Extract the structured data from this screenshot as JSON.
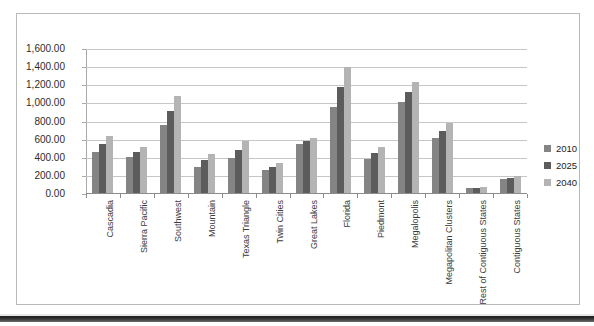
{
  "chart_data": {
    "type": "bar",
    "title": "",
    "subtitle": "",
    "xlabel": "",
    "ylabel": "",
    "ylim": [
      0,
      1600
    ],
    "ytick_step": 200,
    "ytick_labels": [
      "0.00",
      "200.00",
      "400.00",
      "600.00",
      "800.00",
      "1,000.00",
      "1,200.00",
      "1,400.00",
      "1,600.00"
    ],
    "grid": true,
    "legend_position": "right",
    "categories": [
      "Cascadia",
      "Sierra Pacific",
      "Southwest",
      "Mountain",
      "Texas Triangle",
      "Twin Cities",
      "Great Lakes",
      "Florida",
      "Piedmont",
      "Megalopolis",
      "Megapolitan Clusters",
      "Rest of Contiguous States",
      "Contiguous States"
    ],
    "series": [
      {
        "name": "2010",
        "color": "#848484",
        "values": [
          450,
          395,
          755,
          285,
          385,
          250,
          540,
          950,
          370,
          1005,
          610,
          50,
          150
        ]
      },
      {
        "name": "2025",
        "color": "#5c5c5c",
        "values": [
          540,
          450,
          910,
          365,
          470,
          290,
          575,
          1170,
          440,
          1120,
          680,
          55,
          168
        ]
      },
      {
        "name": "2040",
        "color": "#b4b4b4",
        "values": [
          630,
          510,
          1065,
          425,
          575,
          330,
          605,
          1385,
          510,
          1230,
          770,
          62,
          190
        ]
      }
    ]
  },
  "legend": {
    "items": [
      {
        "label": "2010",
        "color": "#848484"
      },
      {
        "label": "2025",
        "color": "#5c5c5c"
      },
      {
        "label": "2040",
        "color": "#b4b4b4"
      }
    ]
  }
}
